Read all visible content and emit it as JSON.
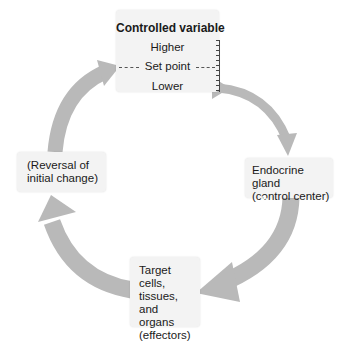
{
  "diagram": {
    "type": "negative-feedback-loop",
    "arrow_color": "#b9b9b9",
    "box_color": "#f3f3f3",
    "nodes": {
      "controlled_variable": {
        "title": "Controlled variable",
        "higher": "Higher",
        "set_point": "Set point",
        "lower": "Lower"
      },
      "control_center": {
        "line1": "Endocrine gland",
        "line2": "(control center)"
      },
      "effectors": {
        "line1": "Target cells,",
        "line2": "tissues, and",
        "line3": "organs",
        "line4": "(effectors)"
      },
      "response": {
        "line1": "(Reversal of",
        "line2": "initial change)"
      }
    },
    "edges": [
      {
        "from": "controlled_variable",
        "to": "control_center",
        "label": ""
      },
      {
        "from": "control_center",
        "to": "effectors",
        "label": "Hormone"
      },
      {
        "from": "effectors",
        "to": "response",
        "label": ""
      },
      {
        "from": "response",
        "to": "controlled_variable",
        "label": ""
      }
    ],
    "hormone_label": "Hormone"
  }
}
